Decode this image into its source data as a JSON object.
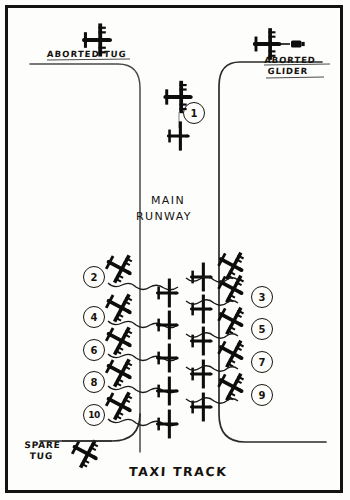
{
  "diagram": {
    "title_labels": {
      "aborted_tug": "ABORTED TUG",
      "aborted_glider_line1": "ABORTED",
      "aborted_glider_line2": "GLIDER",
      "main_runway_line1": "MAIN",
      "main_runway_line2": "RUNWAY",
      "spare_tug_line1": "SPARE",
      "spare_tug_line2": "TUG",
      "taxi_track": "TAXI  TRACK"
    },
    "colors": {
      "ink": "#131313",
      "paper": "#fdfdfb",
      "line": "#3a3a3a"
    },
    "markers": {
      "center": [
        {
          "id": "1",
          "label": "1",
          "x": 183,
          "y": 102
        }
      ],
      "left_column": [
        {
          "id": "2",
          "label": "2",
          "x": 83,
          "y": 266
        },
        {
          "id": "4",
          "label": "4",
          "x": 83,
          "y": 306
        },
        {
          "id": "6",
          "label": "6",
          "x": 83,
          "y": 339
        },
        {
          "id": "8",
          "label": "8",
          "x": 83,
          "y": 371
        },
        {
          "id": "10",
          "label": "10",
          "x": 83,
          "y": 404
        }
      ],
      "right_column": [
        {
          "id": "3",
          "label": "3",
          "x": 251,
          "y": 286
        },
        {
          "id": "5",
          "label": "5",
          "x": 251,
          "y": 318
        },
        {
          "id": "7",
          "label": "7",
          "x": 251,
          "y": 351
        },
        {
          "id": "9",
          "label": "9",
          "x": 251,
          "y": 384
        }
      ]
    },
    "aircraft": {
      "aborted_tug_top": {
        "x": 98,
        "y": 40,
        "type": "tug"
      },
      "aborted_glider_top": {
        "x": 272,
        "y": 42,
        "type": "tug-with-glider"
      },
      "runway_tug": {
        "x": 179,
        "y": 96,
        "type": "tug"
      },
      "runway_glider": {
        "x": 179,
        "y": 134,
        "type": "glider"
      },
      "spare_tug": {
        "x": 86,
        "y": 453,
        "type": "tug"
      },
      "left_tugs_count": 5,
      "mid_gliders_count": 5,
      "mid_gliders2_count": 5,
      "right_tugs_count": 5
    }
  }
}
